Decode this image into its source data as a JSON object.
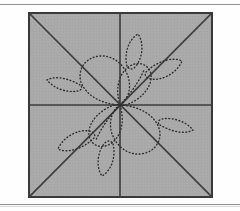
{
  "figure": {
    "kind": "quilting-block-pattern-diagram",
    "title": "Square quilting block with dotted floral motif",
    "panel": {
      "shape": "square",
      "fill_color": "#a9a9a9",
      "border_color": "#3a3a3a",
      "border_width_px": 2,
      "x": 28,
      "y": 12,
      "width": 185,
      "height": 186
    },
    "background_color": "#fefefe",
    "rules": [
      {
        "name": "top-rule",
        "y": 4,
        "color": "#8e8e8e"
      },
      {
        "name": "bottom-rule",
        "y": 204,
        "color": "#8e8e8e"
      }
    ],
    "guide_lines": {
      "color": "#3c3c3c",
      "width_px": 1.6,
      "names": [
        "horizontal-midline",
        "vertical-midline",
        "diagonal-tl-br",
        "diagonal-tr-bl"
      ],
      "count": 4,
      "center": {
        "x": 92,
        "y": 93
      }
    },
    "motif": {
      "stitch_style": "dotted",
      "stitch_color": "#2f2f2f",
      "dot_size_px": 1.4,
      "dash_pattern": "0.8 2.6",
      "symmetry": "180-degree rotational (point) symmetry about center",
      "element_count": 12,
      "elements": [
        "large-petal-upper-left",
        "large-petal-lower-right",
        "inner-petal-upper-left",
        "inner-petal-lower-right",
        "small-leaf-left",
        "small-leaf-right",
        "upper-leaf-vertical",
        "lower-leaf-vertical",
        "upper-right-leaf",
        "lower-left-leaf",
        "stem-upper",
        "stem-lower"
      ]
    }
  },
  "chart_data": {
    "type": "diagram",
    "title": "Square quilting block with dotted floral motif",
    "xlabel": "",
    "ylabel": "",
    "grid": true,
    "legend": "none"
  }
}
